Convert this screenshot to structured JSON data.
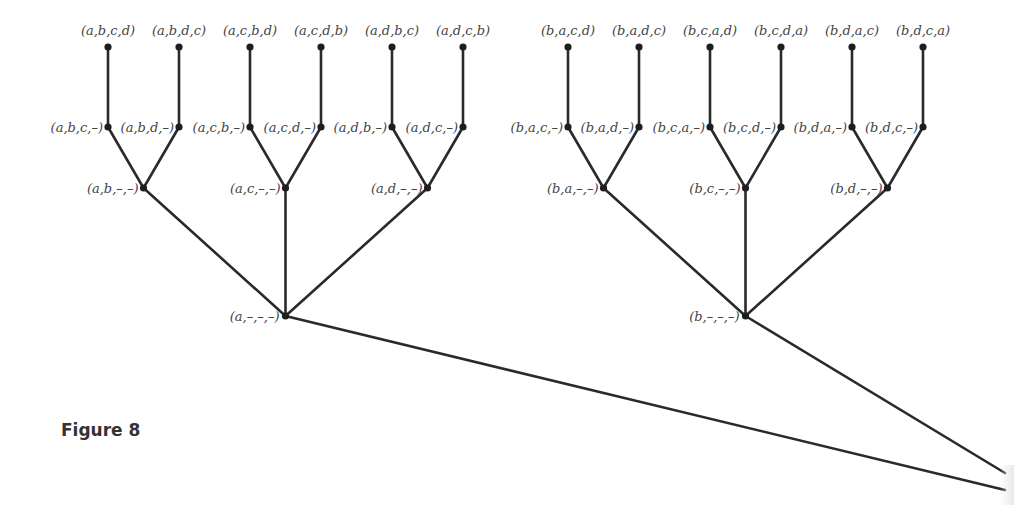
{
  "figure": {
    "caption": "Figure 8"
  },
  "trees": [
    {
      "root": {
        "label": "(a,–,–,–)"
      },
      "branches": [
        {
          "label": "(a,b,–,–)",
          "children": [
            {
              "label": "(a,b,c,–)",
              "leaf": "(a,b,c,d)"
            },
            {
              "label": "(a,b,d,–)",
              "leaf": "(a,b,d,c)"
            }
          ]
        },
        {
          "label": "(a,c,–,–)",
          "children": [
            {
              "label": "(a,c,b,–)",
              "leaf": "(a,c,b,d)"
            },
            {
              "label": "(a,c,d,–)",
              "leaf": "(a,c,d,b)"
            }
          ]
        },
        {
          "label": "(a,d,–,–)",
          "children": [
            {
              "label": "(a,d,b,–)",
              "leaf": "(a,d,b,c)"
            },
            {
              "label": "(a,d,c,–)",
              "leaf": "(a,d,c,b)"
            }
          ]
        }
      ]
    },
    {
      "root": {
        "label": "(b,–,–,–)"
      },
      "branches": [
        {
          "label": "(b,a,–,–)",
          "children": [
            {
              "label": "(b,a,c,–)",
              "leaf": "(b,a,c,d)"
            },
            {
              "label": "(b,a,d,–)",
              "leaf": "(b,a,d,c)"
            }
          ]
        },
        {
          "label": "(b,c,–,–)",
          "children": [
            {
              "label": "(b,c,a,–)",
              "leaf": "(b,c,a,d)"
            },
            {
              "label": "(b,c,d,–)",
              "leaf": "(b,c,d,a)"
            }
          ]
        },
        {
          "label": "(b,d,–,–)",
          "children": [
            {
              "label": "(b,d,a,–)",
              "leaf": "(b,d,a,c)"
            },
            {
              "label": "(b,d,c,–)",
              "leaf": "(b,d,c,a)"
            }
          ]
        }
      ]
    }
  ]
}
